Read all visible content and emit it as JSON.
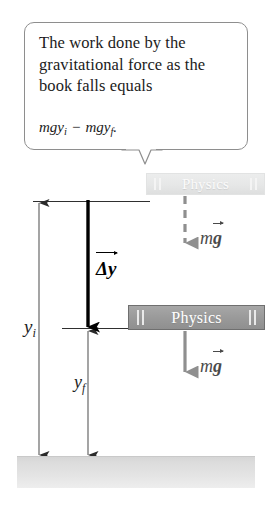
{
  "figure": {
    "type": "physics-diagram"
  },
  "callout": {
    "text": "The work done by the gravitational force as the book falls equals",
    "formula": {
      "term1_base": "mgy",
      "term1_sub": "i",
      "operator": "−",
      "term2_base": "mgy",
      "term2_sub": "f",
      "period": "."
    }
  },
  "books": {
    "initial": {
      "title": "Physics",
      "state": "ghosted-initial-position",
      "color": "#e6e7e7"
    },
    "final": {
      "title": "Physics",
      "state": "solid-final-position",
      "color": "#9a9a9a"
    }
  },
  "vectors": {
    "displacement": {
      "base": "Δy",
      "notation": "vector",
      "color": "#000000",
      "style": "solid-thick"
    },
    "force_initial": {
      "base_m": "m",
      "base_g": "g",
      "notation": "vector",
      "color": "#8a8a8a",
      "style": "dashed"
    },
    "force_final": {
      "base_m": "m",
      "base_g": "g",
      "notation": "vector",
      "color": "#8a8a8a",
      "style": "solid"
    }
  },
  "measurements": {
    "initial_height": {
      "base": "y",
      "sub": "i"
    },
    "final_height": {
      "base": "y",
      "sub": "f"
    }
  },
  "ground": {
    "label": "",
    "color": "#dcdcdc"
  }
}
